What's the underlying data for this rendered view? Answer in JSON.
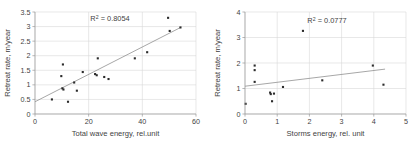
{
  "figure": {
    "panel_count": 2,
    "background": "#ffffff",
    "point_color": "#2b2b2b",
    "grid_color": "#d9d9d9",
    "axis_color": "#9a9a9a",
    "trend_color": "#8a8a8a"
  },
  "chart_data": [
    {
      "id": "left",
      "type": "scatter",
      "title": "",
      "xlabel": "Total wave energy, rel.unit",
      "ylabel": "Retreat rate, m/year",
      "xlim": [
        0,
        60
      ],
      "ylim": [
        0,
        3.5
      ],
      "xticks": [
        0,
        20,
        40,
        60
      ],
      "xtick_labels": [
        "0",
        "20",
        "40",
        "60"
      ],
      "yticks": [
        0,
        0.5,
        1,
        1.5,
        2,
        2.5,
        3,
        3.5
      ],
      "ytick_labels": [
        "0",
        "0.5",
        "1",
        "1.5",
        "2",
        "2.5",
        "3",
        "3.5"
      ],
      "grid": true,
      "legend": "none",
      "annotation": "R² = 0.8054",
      "annotation_base": "R",
      "annotation_sup": "2",
      "annotation_rest": " = 0.8054",
      "r_squared": 0.8054,
      "trendline": {
        "type": "linear",
        "x": [
          0,
          54.5
        ],
        "y": [
          0.42,
          2.98
        ],
        "slope": 0.047,
        "intercept": 0.42
      },
      "points": [
        {
          "x": 6.3,
          "y": 0.5
        },
        {
          "x": 9.8,
          "y": 1.3
        },
        {
          "x": 10.4,
          "y": 1.7
        },
        {
          "x": 10.2,
          "y": 0.88
        },
        {
          "x": 10.6,
          "y": 0.84
        },
        {
          "x": 12.3,
          "y": 0.42
        },
        {
          "x": 14.6,
          "y": 1.08
        },
        {
          "x": 15.6,
          "y": 0.8
        },
        {
          "x": 17.8,
          "y": 1.44
        },
        {
          "x": 22.4,
          "y": 1.37
        },
        {
          "x": 23.0,
          "y": 1.33
        },
        {
          "x": 23.4,
          "y": 1.91
        },
        {
          "x": 25.8,
          "y": 1.27
        },
        {
          "x": 27.4,
          "y": 1.2
        },
        {
          "x": 37.2,
          "y": 1.91
        },
        {
          "x": 41.8,
          "y": 2.12
        },
        {
          "x": 49.6,
          "y": 3.3
        },
        {
          "x": 50.2,
          "y": 2.85
        },
        {
          "x": 54.2,
          "y": 2.97
        }
      ]
    },
    {
      "id": "right",
      "type": "scatter",
      "title": "",
      "xlabel": "Storms energy, rel. unit",
      "ylabel": "Retreat rate, m/year",
      "xlim": [
        0,
        5
      ],
      "ylim": [
        0,
        4
      ],
      "xticks": [
        0,
        1,
        2,
        3,
        4,
        5
      ],
      "xtick_labels": [
        "0",
        "1",
        "2",
        "3",
        "4",
        "5"
      ],
      "yticks": [
        0,
        1,
        2,
        3,
        4
      ],
      "ytick_labels": [
        "0",
        "1",
        "2",
        "3",
        "4"
      ],
      "grid": true,
      "legend": "none",
      "annotation": "R² = 0.0777",
      "annotation_base": "R",
      "annotation_sup": "2",
      "annotation_rest": " = 0.0777",
      "r_squared": 0.0777,
      "trendline": {
        "type": "linear",
        "x": [
          0,
          4.35
        ],
        "y": [
          1.09,
          1.76
        ],
        "slope": 0.154,
        "intercept": 1.09
      },
      "points": [
        {
          "x": 0.02,
          "y": 0.4
        },
        {
          "x": 0.3,
          "y": 1.9
        },
        {
          "x": 0.3,
          "y": 1.72
        },
        {
          "x": 0.3,
          "y": 1.26
        },
        {
          "x": 0.78,
          "y": 0.84
        },
        {
          "x": 0.8,
          "y": 0.78
        },
        {
          "x": 0.9,
          "y": 0.8
        },
        {
          "x": 0.84,
          "y": 0.5
        },
        {
          "x": 1.18,
          "y": 1.06
        },
        {
          "x": 1.8,
          "y": 3.26
        },
        {
          "x": 2.4,
          "y": 1.32
        },
        {
          "x": 3.97,
          "y": 1.9
        },
        {
          "x": 4.3,
          "y": 1.15
        }
      ]
    }
  ]
}
